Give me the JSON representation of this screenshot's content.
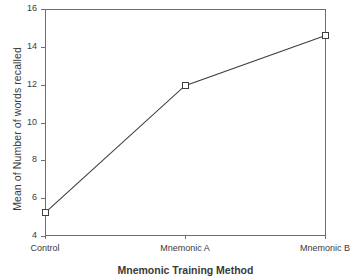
{
  "chart_data": {
    "type": "line",
    "title": "",
    "xlabel": "Mnemonic Training Method",
    "ylabel": "Mean of Number of words recalled",
    "categories": [
      "Control",
      "Mnemonic A",
      "Mnemonic B"
    ],
    "values": [
      5.25,
      11.95,
      14.6
    ],
    "series": [
      {
        "name": "Mean of Number of words recalled",
        "values": [
          5.25,
          11.95,
          14.6
        ]
      }
    ],
    "ylim": [
      4,
      16
    ],
    "yticks": [
      4,
      6,
      8,
      10,
      12,
      14,
      16
    ],
    "ytick_labels": [
      "4",
      "6",
      "8",
      "10",
      "12",
      "14",
      "16"
    ],
    "xtick_labels": [
      "Control",
      "Mnemonic A",
      "Mnemonic B"
    ],
    "grid": false,
    "legend": false,
    "legend_position": "none",
    "marker": "open-square",
    "line_color": "#3f3f3f",
    "marker_face_color": "#ffffff",
    "marker_edge_color": "#3f3f3f",
    "axis_color": "#6d6d6d",
    "background_color": "#ffffff"
  }
}
